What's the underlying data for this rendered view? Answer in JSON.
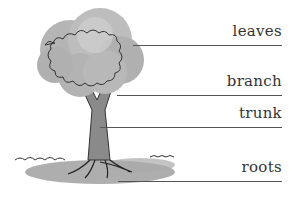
{
  "diagram": {
    "labels": [
      {
        "text": "leaves",
        "line_y": 45,
        "line_x0": 133,
        "line_x1": 282
      },
      {
        "text": "branch",
        "line_y": 95,
        "line_x0": 117,
        "line_x1": 282
      },
      {
        "text": "trunk",
        "line_y": 127,
        "line_x0": 100,
        "line_x1": 282
      },
      {
        "text": "roots",
        "line_y": 181,
        "line_x0": 118,
        "line_x1": 282
      }
    ]
  }
}
